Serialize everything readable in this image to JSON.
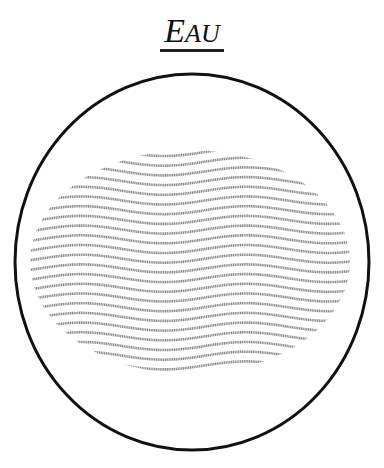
{
  "title": {
    "first_letter": "E",
    "rest": "AU"
  },
  "illustration": {
    "subject": "water-symbol",
    "circle": {
      "cx": 192,
      "cy": 262,
      "rx": 177,
      "ry": 188,
      "stroke": "#111111",
      "stroke_width": 3
    },
    "waves": {
      "count": 23,
      "top": 152,
      "spacing": 9.7,
      "color": "#8a8a8a",
      "amplitude": 4,
      "period": 165
    }
  }
}
